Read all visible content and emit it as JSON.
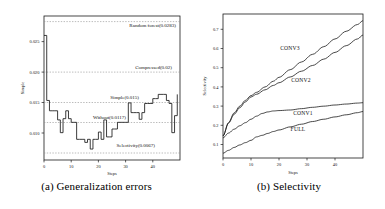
{
  "figure": {
    "background": "#ffffff",
    "line_color": "#1a1a1a",
    "grid_color": "#999999"
  },
  "panel_a": {
    "caption": "(a) Generalization errors",
    "chart_data": {
      "type": "line",
      "title": "",
      "xlabel": "Steps",
      "ylabel": "Simple",
      "xlim": [
        0,
        50
      ],
      "ylim": [
        0.0055,
        0.0292
      ],
      "xticks": [
        0,
        10,
        20,
        30,
        40
      ],
      "xtick_labels": [
        "0",
        "10",
        "20",
        "30",
        "40"
      ],
      "yticks": [
        0.01,
        0.015,
        0.02,
        0.025
      ],
      "ytick_labels": [
        "0.010",
        "0.015",
        "0.020",
        "0.025"
      ],
      "grid": "horizontal-dotted-reference-lines",
      "legend_position": "inline-annotations",
      "reference_lines": [
        {
          "label": "Random forest(0.0283)",
          "value": 0.0283,
          "name": "Random forest"
        },
        {
          "label": "Compressed(0.02)",
          "value": 0.02,
          "name": "Compressed"
        },
        {
          "label": "Simple(0.015)",
          "value": 0.015,
          "name": "Simple"
        },
        {
          "label": "Without(0.0117)",
          "value": 0.0117,
          "name": "Without"
        },
        {
          "label": "Selectivity(0.0067)",
          "value": 0.0067,
          "name": "Selectivity"
        }
      ],
      "series": [
        {
          "name": "generalization-error",
          "x": [
            0,
            1,
            2,
            3,
            4,
            5,
            6,
            7,
            8,
            9,
            10,
            11,
            12,
            13,
            14,
            15,
            16,
            17,
            18,
            19,
            20,
            21,
            22,
            23,
            24,
            25,
            26,
            27,
            28,
            29,
            30,
            31,
            32,
            33,
            34,
            35,
            36,
            37,
            38,
            39,
            40,
            41,
            42,
            43,
            44,
            45,
            46,
            47,
            48,
            49
          ],
          "values": [
            0.026,
            0.0153,
            0.0136,
            0.0136,
            0.0136,
            0.0121,
            0.01,
            0.0123,
            0.0136,
            0.0123,
            0.0117,
            0.0117,
            0.0089,
            0.0089,
            0.0089,
            0.0084,
            0.0089,
            0.0073,
            0.0089,
            0.0089,
            0.0101,
            0.0089,
            0.0121,
            0.0093,
            0.0093,
            0.0106,
            0.0106,
            0.0117,
            0.0117,
            0.0117,
            0.0117,
            0.0149,
            0.0133,
            0.0133,
            0.0133,
            0.0122,
            0.0133,
            0.0148,
            0.0148,
            0.0148,
            0.0156,
            0.0156,
            0.0163,
            0.0163,
            0.0163,
            0.0153,
            0.0148,
            0.01,
            0.0128,
            0.0163
          ]
        }
      ]
    }
  },
  "panel_b": {
    "caption": "(b) Selectivity",
    "chart_data": {
      "type": "line",
      "title": "",
      "xlabel": "Steps",
      "ylabel": "Selectivity",
      "xlim": [
        0,
        50
      ],
      "ylim": [
        0.03,
        0.78
      ],
      "xticks": [
        0,
        10,
        20,
        30,
        40
      ],
      "xtick_labels": [
        "0",
        "10",
        "20",
        "30",
        "40"
      ],
      "yticks": [
        0.1,
        0.2,
        0.3,
        0.4,
        0.5,
        0.6,
        0.7
      ],
      "ytick_labels": [
        "0.1",
        "0.2",
        "0.3",
        "0.4",
        "0.5",
        "0.6",
        "0.7"
      ],
      "grid": "off",
      "legend_position": "inline-curve-labels",
      "series": [
        {
          "name": "CONV3",
          "label": "CONV3",
          "x": [
            0,
            2,
            4,
            6,
            8,
            10,
            12,
            15,
            18,
            20,
            24,
            28,
            32,
            36,
            40,
            44,
            48,
            50
          ],
          "values": [
            0.145,
            0.215,
            0.265,
            0.3,
            0.33,
            0.355,
            0.372,
            0.4,
            0.43,
            0.45,
            0.49,
            0.53,
            0.57,
            0.61,
            0.65,
            0.69,
            0.725,
            0.745
          ]
        },
        {
          "name": "CONV2",
          "label": "CONV2",
          "x": [
            0,
            2,
            4,
            6,
            8,
            10,
            12,
            15,
            18,
            20,
            24,
            28,
            32,
            36,
            40,
            44,
            48,
            50
          ],
          "values": [
            0.145,
            0.212,
            0.258,
            0.292,
            0.322,
            0.348,
            0.362,
            0.385,
            0.408,
            0.422,
            0.452,
            0.482,
            0.512,
            0.545,
            0.58,
            0.615,
            0.65,
            0.67
          ]
        },
        {
          "name": "CONV1",
          "label": "CONV1",
          "x": [
            0,
            2,
            4,
            6,
            8,
            10,
            12,
            14,
            16,
            18,
            20,
            24,
            28,
            32,
            36,
            40,
            44,
            48,
            50
          ],
          "values": [
            0.135,
            0.16,
            0.18,
            0.198,
            0.214,
            0.232,
            0.248,
            0.262,
            0.27,
            0.275,
            0.277,
            0.28,
            0.287,
            0.294,
            0.3,
            0.306,
            0.311,
            0.316,
            0.318
          ]
        },
        {
          "name": "FULL",
          "label": "FULL",
          "x": [
            0,
            2,
            4,
            6,
            8,
            10,
            12,
            14,
            16,
            18,
            20,
            24,
            28,
            32,
            36,
            40,
            44,
            48,
            50
          ],
          "values": [
            0.055,
            0.07,
            0.085,
            0.098,
            0.11,
            0.122,
            0.14,
            0.148,
            0.158,
            0.168,
            0.176,
            0.192,
            0.206,
            0.22,
            0.232,
            0.244,
            0.255,
            0.266,
            0.272
          ]
        }
      ]
    }
  }
}
